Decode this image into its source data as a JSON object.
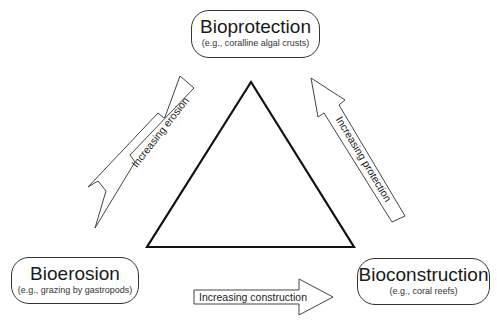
{
  "nodes": {
    "top": {
      "title": "Bioprotection",
      "example": "(e.g., coralline algal crusts)"
    },
    "left": {
      "title": "Bioerosion",
      "example": "(e.g., grazing by gastropods)"
    },
    "right": {
      "title": "Bioconstruction",
      "example": "(e.g., coral reefs)"
    }
  },
  "arrows": {
    "erosion": "Increasing erosion",
    "protection": "Increasing protection",
    "construction": "Increasing construction"
  },
  "colors": {
    "stroke": "#333333",
    "triangle": "#111111",
    "background": "#ffffff"
  }
}
